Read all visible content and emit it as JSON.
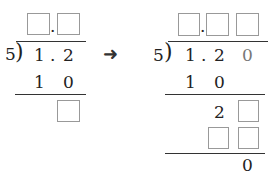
{
  "left": {
    "divisor": "5",
    "dividend": [
      "1",
      ".",
      "2"
    ],
    "product": [
      "1",
      "0"
    ],
    "quotient_dot": "."
  },
  "right": {
    "divisor": "5",
    "dividend": [
      "1",
      ".",
      "2",
      "0"
    ],
    "product1": [
      "1",
      "0"
    ],
    "remainder_digit": "2",
    "final": "0",
    "quotient_dot": "."
  },
  "arrow": "➜"
}
